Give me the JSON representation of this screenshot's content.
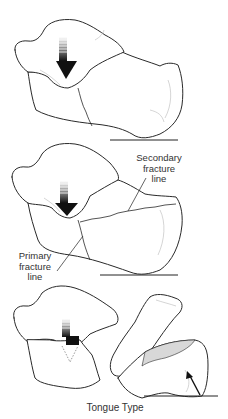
{
  "figure": {
    "caption": "Tongue Type",
    "panels": [
      {
        "id": "panel-1",
        "description": "Intact calcaneus with talus; downward force arrow on talus"
      },
      {
        "id": "panel-2",
        "description": "Primary and secondary fracture lines forming tongue fragment",
        "labels": {
          "secondary": "Secondary\nfracture\nline",
          "primary": "Primary\nfracture\nline"
        }
      },
      {
        "id": "panel-3",
        "description": "Displaced tongue fragment rotated upward; arrow pointing to fragment"
      }
    ]
  },
  "colors": {
    "line": "#2a2a2a",
    "arrow": "#111111",
    "text": "#333333",
    "background": "#ffffff"
  }
}
